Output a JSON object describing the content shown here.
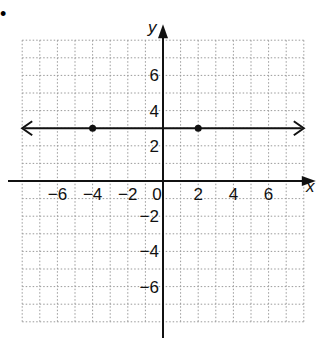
{
  "bullet": "•",
  "chart_data": {
    "type": "line",
    "title": "",
    "xlabel": "x",
    "ylabel": "y",
    "xlim": [
      -8,
      8
    ],
    "ylim": [
      -8,
      8
    ],
    "grid": true,
    "grid_style": "dotted",
    "x_ticks": [
      -6,
      -4,
      -2,
      0,
      2,
      4,
      6
    ],
    "y_ticks": [
      6,
      4,
      2,
      -2,
      -4,
      -6
    ],
    "x_tick_labels": [
      "−6",
      "−4",
      "−2",
      "0",
      "2",
      "4",
      "6"
    ],
    "y_tick_labels": [
      "6",
      "4",
      "2",
      "−2",
      "−4",
      "−6"
    ],
    "series": [
      {
        "name": "horizontal line y = 3",
        "equation": "y = 3",
        "arrows_both_ends": true,
        "x": [
          -8,
          8
        ],
        "y": [
          3,
          3
        ],
        "points": [
          {
            "x": -4,
            "y": 3
          },
          {
            "x": 2,
            "y": 3
          }
        ]
      }
    ]
  },
  "colors": {
    "line": "#111111",
    "grid": "#9a9a9a",
    "background": "#ffffff"
  }
}
